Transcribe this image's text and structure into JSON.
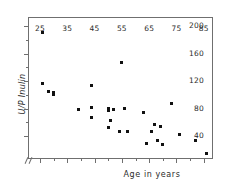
{
  "chart_data": {
    "type": "scatter",
    "title": "",
    "xlabel": "Age in years",
    "ylabel": "U/P Inulin",
    "xlim": [
      21,
      88
    ],
    "ylim": [
      8,
      212
    ],
    "grid": false,
    "legend": null,
    "xticks": [
      25,
      35,
      45,
      55,
      65,
      75,
      85
    ],
    "xtick_labels": [
      "25",
      "35",
      "45",
      "55",
      "65",
      "75",
      "85"
    ],
    "xminor_ticks": [
      30,
      40,
      50,
      60,
      70,
      80
    ],
    "yticks": [
      40,
      80,
      120,
      160,
      200
    ],
    "ytick_labels": [
      "40",
      "80",
      "120",
      "160",
      "200"
    ],
    "yminor_ticks": [
      60,
      100,
      140,
      180
    ],
    "axis_break": true,
    "marker": "square",
    "marker_color": "#111111",
    "marker_size_px": 3,
    "points": [
      {
        "x": 26,
        "y": 191
      },
      {
        "x": 26,
        "y": 116
      },
      {
        "x": 28,
        "y": 105
      },
      {
        "x": 30,
        "y": 101
      },
      {
        "x": 30,
        "y": 104
      },
      {
        "x": 39,
        "y": 79
      },
      {
        "x": 44,
        "y": 113
      },
      {
        "x": 44,
        "y": 81
      },
      {
        "x": 44,
        "y": 67
      },
      {
        "x": 50,
        "y": 80
      },
      {
        "x": 50,
        "y": 77
      },
      {
        "x": 50,
        "y": 52
      },
      {
        "x": 51,
        "y": 63
      },
      {
        "x": 52,
        "y": 79
      },
      {
        "x": 54,
        "y": 46
      },
      {
        "x": 55,
        "y": 147
      },
      {
        "x": 56,
        "y": 80
      },
      {
        "x": 57,
        "y": 46
      },
      {
        "x": 63,
        "y": 74
      },
      {
        "x": 64,
        "y": 29
      },
      {
        "x": 66,
        "y": 46
      },
      {
        "x": 67,
        "y": 57
      },
      {
        "x": 68,
        "y": 33
      },
      {
        "x": 69,
        "y": 54
      },
      {
        "x": 70,
        "y": 28
      },
      {
        "x": 73,
        "y": 87
      },
      {
        "x": 76,
        "y": 42
      },
      {
        "x": 82,
        "y": 34
      },
      {
        "x": 86,
        "y": 15
      }
    ]
  }
}
